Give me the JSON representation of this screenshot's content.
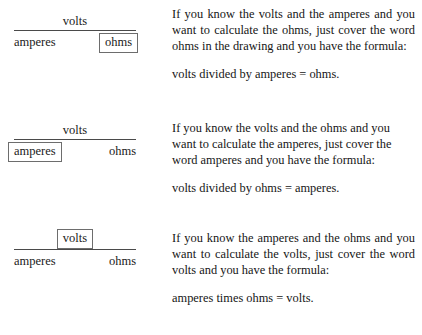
{
  "document": {
    "title": "Ohm's Law cover-the-word diagrams",
    "background_color": "#ffffff",
    "text_color": "#161616",
    "rule_color": "#4a4a4a",
    "box_border_color": "#6d6d6d"
  },
  "diagrams": [
    {
      "id": "diagram-ohms",
      "numerator": "volts",
      "denominator_left": "amperes",
      "denominator_right": "ohms",
      "boxed_term": "ohms",
      "boxed_position": "denominator-right"
    },
    {
      "id": "diagram-amperes",
      "numerator": "volts",
      "denominator_left": "amperes",
      "denominator_right": "ohms",
      "boxed_term": "amperes",
      "boxed_position": "denominator-left"
    },
    {
      "id": "diagram-volts",
      "numerator": "volts",
      "denominator_left": "amperes",
      "denominator_right": "ohms",
      "boxed_term": "volts",
      "boxed_position": "numerator"
    }
  ],
  "blocks": [
    {
      "id": "block-ohms",
      "paragraph": "If you know the volts and the amperes and you want to calculate the ohms, just cover the word ohms in the drawing and you have the formula:",
      "formula": "volts divided by amperes = ohms."
    },
    {
      "id": "block-amperes",
      "paragraph": "If you know the volts and the ohms and you want to calculate the amperes, just cover the word amperes and you have the formula:",
      "formula": "volts divided by ohms = amperes."
    },
    {
      "id": "block-volts",
      "paragraph": "If you know the amperes and the ohms and you want to calculate the volts, just cover the word volts and you have the formula:",
      "formula": "amperes times ohms = volts."
    }
  ]
}
